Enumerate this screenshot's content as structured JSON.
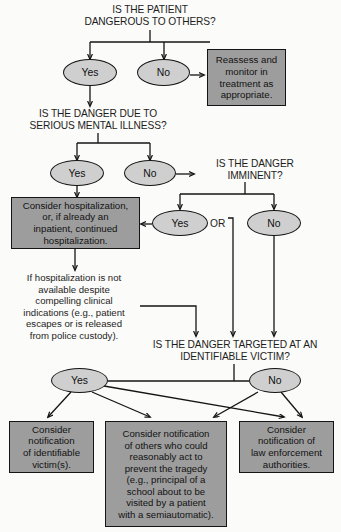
{
  "palette": {
    "page_background": "#fbfbf9",
    "ellipse_fill": "#cfcfcf",
    "box_fill": "#9d9d9d",
    "stroke": "#141414",
    "text": "#1d1d1d"
  },
  "questions": {
    "q1": "IS THE PATIENT\nDANGEROUS TO OTHERS?",
    "q2": "IS THE DANGER DUE TO\nSERIOUS MENTAL ILLNESS?",
    "q3": "IS THE DANGER\nIMMINENT?",
    "q4": "IS THE DANGER TARGETED AT AN\nIDENTIFIABLE VICTIM?"
  },
  "nodes": {
    "q1_yes": "Yes",
    "q1_no": "No",
    "q2_yes": "Yes",
    "q2_no": "No",
    "q3_yes": "Yes",
    "q3_no": "No",
    "q4_yes": "Yes",
    "q4_no": "No"
  },
  "connector_labels": {
    "or": "OR"
  },
  "boxes": {
    "reassess": "Reassess and\nmonitor in\ntreatment as\nappropriate.",
    "hospitalize": "Consider hospitalization,\nor, if already an\ninpatient, continued\nhospitalization.",
    "notify_victim": "Consider\nnotification\nof identifiable\nvictim(s).",
    "notify_others": "Consider notification\nof others who could\nreasonably act to\nprevent the tragedy\n(e.g., principal of a\nschool about to be\nvisited by a patient\nwith a semiautomatic).",
    "notify_police": "Consider\nnotification of\nlaw enforcement\nauthorities."
  },
  "notes": {
    "unavailable": "If hospitalization is not\navailable despite\ncompelling clinical\nindications (e.g., patient\nescapes or is released\nfrom police custody)."
  }
}
